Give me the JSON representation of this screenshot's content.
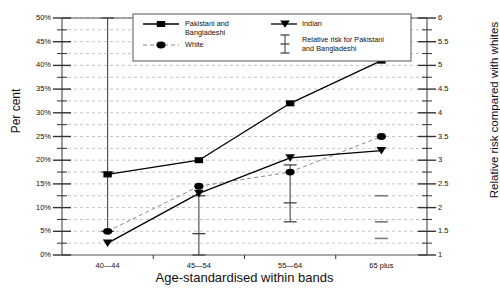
{
  "chart_data": {
    "type": "line",
    "title": "",
    "xlabel": "Age-standardised within bands",
    "ylabel": "Per cent",
    "ylabel_right": "Relative risk compared with whites",
    "categories": [
      "40—44",
      "45—54",
      "55—64",
      "65 plus"
    ],
    "ylim": [
      0,
      50
    ],
    "yticks": [
      "0%",
      "5%",
      "10%",
      "15%",
      "20%",
      "25%",
      "30%",
      "35%",
      "40%",
      "45%",
      "50%"
    ],
    "ylim_right": [
      1,
      6
    ],
    "yticks_right": [
      "1",
      "1.5",
      "2",
      "2.5",
      "3",
      "3.5",
      "4",
      "4.5",
      "5",
      "5.5",
      "6"
    ],
    "grid": true,
    "legend_position": "top-center",
    "series": [
      {
        "name": "Pakistani and Bangladeshi",
        "marker": "square",
        "linestyle": "solid",
        "values": [
          17.0,
          20.0,
          32.0,
          41.0
        ]
      },
      {
        "name": "White",
        "marker": "ellipse",
        "linestyle": "dashed",
        "values": [
          5.0,
          14.5,
          17.5,
          25.0
        ]
      },
      {
        "name": "Indian",
        "marker": "triangle-down",
        "linestyle": "solid",
        "values": [
          2.5,
          13.0,
          20.5,
          22.0
        ]
      }
    ],
    "error_bars": {
      "name": "Relative risk for Pakistani and Bangladeshi",
      "axis": "right",
      "points": [
        {
          "category": "40—44",
          "value": 2.75,
          "low": 1.5,
          "high": 6.0,
          "faded": false
        },
        {
          "category": "45—54",
          "value": 1.45,
          "low": 1.0,
          "high": 2.25,
          "faded": false
        },
        {
          "category": "55—64",
          "value": 2.1,
          "low": 1.7,
          "high": 2.9,
          "faded": false
        },
        {
          "category": "65 plus",
          "value": 1.7,
          "low": 1.35,
          "high": 2.25,
          "faded": true
        }
      ]
    },
    "legend": [
      {
        "label_line1": "Pakistani and",
        "label_line2": "Bangladeshi",
        "marker": "square",
        "linestyle": "solid"
      },
      {
        "label_line1": "White",
        "label_line2": "",
        "marker": "ellipse",
        "linestyle": "dashed"
      },
      {
        "label_line1": "Indian",
        "label_line2": "",
        "marker": "triangle-down",
        "linestyle": "solid"
      },
      {
        "label_line1": "Relative risk for Pakistani",
        "label_line2": "and Bangladeshi",
        "marker": "errorbar",
        "linestyle": "none"
      }
    ],
    "colors": {
      "line": "#000000",
      "grid": "#b4b4b4",
      "axis": "#555555",
      "text": "#111111",
      "faded": "#7a7a7a"
    }
  }
}
